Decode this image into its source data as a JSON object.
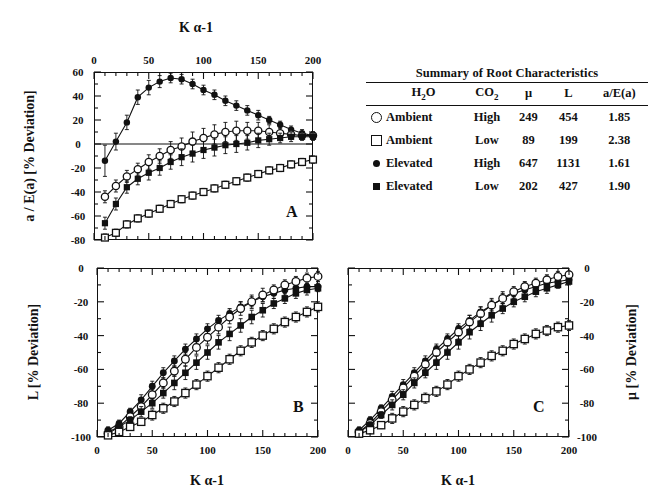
{
  "figure": {
    "top_title": "K α-1",
    "bottom_title": "K α-1"
  },
  "legend": {
    "caption": "Summary of Root Characteristics",
    "columns": [
      "H₂O",
      "CO₂",
      "μ",
      "L",
      "a/E(a)"
    ],
    "rows": [
      {
        "marker": "open-circle",
        "h2o": "Ambient",
        "co2": "High",
        "mu": "249",
        "L": "454",
        "ratio": "1.85"
      },
      {
        "marker": "open-square",
        "h2o": "Ambient",
        "co2": "Low",
        "mu": "89",
        "L": "199",
        "ratio": "2.38"
      },
      {
        "marker": "filled-circle",
        "h2o": "Elevated",
        "co2": "High",
        "mu": "647",
        "L": "1131",
        "ratio": "1.61"
      },
      {
        "marker": "filled-square",
        "h2o": "Elevated",
        "co2": "Low",
        "mu": "202",
        "L": "427",
        "ratio": "1.90"
      }
    ]
  },
  "chart_data": [
    {
      "id": "A",
      "type": "line",
      "panel_letter": "A",
      "title": "K α-1",
      "xlabel": "K α-1",
      "ylabel": "a / E(a) [% Deviation]",
      "xlim": [
        0,
        200
      ],
      "ylim": [
        -80,
        60
      ],
      "xticks": [
        0,
        50,
        100,
        150,
        200
      ],
      "yticks": [
        -80,
        -60,
        -40,
        -20,
        0,
        20,
        40,
        60
      ],
      "xtick_labels": [
        "0",
        "50",
        "100",
        "150",
        "200"
      ],
      "ytick_labels": [
        "-80",
        "-60",
        "-40",
        "-20",
        "0",
        "20",
        "40",
        "60"
      ],
      "xaxis_position": "top",
      "yaxis_position": "left",
      "grid": false,
      "zero_line": true,
      "legend_position": "external-table",
      "x": [
        10,
        20,
        30,
        40,
        50,
        60,
        70,
        80,
        90,
        100,
        110,
        120,
        130,
        140,
        150,
        160,
        170,
        180,
        190,
        200
      ],
      "series": [
        {
          "name": "Elevated / High",
          "marker": "filled-circle",
          "values": [
            -14,
            2,
            18,
            39,
            47,
            52,
            55,
            54,
            50,
            45,
            41,
            36,
            32,
            28,
            24,
            20,
            16,
            12,
            9,
            7
          ],
          "errors": [
            13,
            7,
            6,
            6,
            6,
            5,
            4,
            4,
            4,
            4,
            4,
            4,
            4,
            4,
            4,
            3,
            3,
            3,
            3,
            3
          ]
        },
        {
          "name": "Ambient / High",
          "marker": "open-circle",
          "values": [
            -44,
            -35,
            -27,
            -21,
            -15,
            -10,
            -5,
            -2,
            2,
            5,
            8,
            10,
            11,
            11,
            11,
            10,
            9,
            8,
            7,
            7
          ],
          "errors": [
            5,
            5,
            5,
            5,
            6,
            6,
            7,
            7,
            8,
            8,
            8,
            8,
            8,
            7,
            7,
            6,
            5,
            4,
            3,
            3
          ]
        },
        {
          "name": "Elevated / Low",
          "marker": "filled-square",
          "values": [
            -66,
            -50,
            -36,
            -29,
            -24,
            -20,
            -15,
            -11,
            -8,
            -5,
            -3,
            -1,
            0,
            1,
            3,
            4,
            5,
            6,
            6,
            6
          ],
          "errors": [
            5,
            5,
            5,
            5,
            6,
            6,
            6,
            7,
            7,
            7,
            7,
            7,
            7,
            6,
            6,
            5,
            4,
            4,
            3,
            3
          ]
        },
        {
          "name": "Ambient / Low",
          "marker": "open-square",
          "values": [
            -78,
            -74,
            -67,
            -62,
            -58,
            -54,
            -50,
            -46,
            -43,
            -40,
            -37,
            -34,
            -31,
            -28,
            -25,
            -22,
            -20,
            -17,
            -15,
            -13
          ],
          "errors": [
            3,
            3,
            3,
            3,
            3,
            3,
            3,
            3,
            3,
            3,
            3,
            3,
            3,
            3,
            3,
            3,
            3,
            3,
            3,
            3
          ]
        }
      ]
    },
    {
      "id": "B",
      "type": "line",
      "panel_letter": "B",
      "xlabel": "K α-1",
      "ylabel": "L [% Deviation]",
      "xlim": [
        0,
        200
      ],
      "ylim": [
        -100,
        0
      ],
      "xticks": [
        0,
        50,
        100,
        150,
        200
      ],
      "yticks": [
        -100,
        -80,
        -60,
        -40,
        -20,
        0
      ],
      "xtick_labels": [
        "0",
        "50",
        "100",
        "150",
        "200"
      ],
      "ytick_labels": [
        "-100",
        "-80",
        "-60",
        "-40",
        "-20",
        "0"
      ],
      "xaxis_position": "bottom",
      "yaxis_position": "left",
      "grid": false,
      "x": [
        10,
        20,
        30,
        40,
        50,
        60,
        70,
        80,
        90,
        100,
        110,
        120,
        130,
        140,
        150,
        160,
        170,
        180,
        190,
        200
      ],
      "series": [
        {
          "name": "Elevated / High",
          "marker": "filled-circle",
          "values": [
            -96,
            -92,
            -85,
            -78,
            -70,
            -62,
            -55,
            -48,
            -42,
            -36,
            -31,
            -27,
            -23,
            -20,
            -17,
            -15,
            -13,
            -12,
            -11,
            -11
          ],
          "errors": [
            2,
            2,
            2,
            3,
            3,
            3,
            3,
            3,
            3,
            3,
            3,
            3,
            3,
            3,
            3,
            3,
            3,
            3,
            2,
            2
          ]
        },
        {
          "name": "Ambient / High",
          "marker": "open-circle",
          "values": [
            -98,
            -94,
            -88,
            -82,
            -75,
            -68,
            -61,
            -54,
            -47,
            -41,
            -35,
            -29,
            -24,
            -20,
            -16,
            -13,
            -10,
            -8,
            -6,
            -5
          ],
          "errors": [
            2,
            2,
            2,
            3,
            3,
            3,
            3,
            4,
            4,
            4,
            4,
            4,
            4,
            4,
            4,
            3,
            3,
            3,
            3,
            3
          ]
        },
        {
          "name": "Elevated / Low",
          "marker": "filled-square",
          "values": [
            -97,
            -94,
            -90,
            -85,
            -80,
            -74,
            -68,
            -62,
            -56,
            -50,
            -44,
            -39,
            -34,
            -29,
            -25,
            -21,
            -18,
            -15,
            -13,
            -12
          ],
          "errors": [
            2,
            2,
            2,
            3,
            3,
            3,
            4,
            4,
            4,
            4,
            4,
            4,
            4,
            4,
            4,
            3,
            3,
            3,
            3,
            2
          ]
        },
        {
          "name": "Ambient / Low",
          "marker": "open-square",
          "values": [
            -99,
            -97,
            -94,
            -91,
            -87,
            -83,
            -79,
            -74,
            -69,
            -64,
            -59,
            -54,
            -49,
            -44,
            -40,
            -36,
            -32,
            -29,
            -26,
            -23
          ],
          "errors": [
            1,
            2,
            2,
            2,
            3,
            3,
            3,
            3,
            3,
            3,
            3,
            3,
            3,
            3,
            3,
            3,
            3,
            3,
            3,
            3
          ]
        }
      ]
    },
    {
      "id": "C",
      "type": "line",
      "panel_letter": "C",
      "xlabel": "K α-1",
      "ylabel": "μ [% Deviation]",
      "xlim": [
        0,
        200
      ],
      "ylim": [
        -100,
        0
      ],
      "xticks": [
        0,
        50,
        100,
        150,
        200
      ],
      "yticks": [
        -100,
        -80,
        -60,
        -40,
        -20,
        0
      ],
      "xtick_labels": [
        "0",
        "50",
        "100",
        "150",
        "200"
      ],
      "ytick_labels": [
        "-100",
        "-80",
        "-60",
        "-40",
        "-20",
        "0"
      ],
      "xaxis_position": "bottom",
      "yaxis_position": "right",
      "grid": false,
      "x": [
        10,
        20,
        30,
        40,
        50,
        60,
        70,
        80,
        90,
        100,
        110,
        120,
        130,
        140,
        150,
        160,
        170,
        180,
        190,
        200
      ],
      "series": [
        {
          "name": "Elevated / High",
          "marker": "filled-circle",
          "values": [
            -96,
            -90,
            -83,
            -76,
            -69,
            -62,
            -55,
            -48,
            -42,
            -36,
            -31,
            -26,
            -22,
            -18,
            -15,
            -13,
            -11,
            -9,
            -8,
            -7
          ],
          "errors": [
            2,
            2,
            2,
            3,
            3,
            3,
            3,
            3,
            3,
            3,
            3,
            3,
            3,
            3,
            3,
            3,
            2,
            2,
            2,
            2
          ]
        },
        {
          "name": "Ambient / High",
          "marker": "open-circle",
          "values": [
            -97,
            -92,
            -85,
            -78,
            -71,
            -64,
            -57,
            -50,
            -44,
            -38,
            -32,
            -27,
            -22,
            -18,
            -14,
            -11,
            -9,
            -7,
            -5,
            -4
          ],
          "errors": [
            2,
            2,
            2,
            3,
            3,
            3,
            3,
            4,
            4,
            4,
            4,
            4,
            4,
            4,
            3,
            3,
            3,
            3,
            3,
            2
          ]
        },
        {
          "name": "Elevated / Low",
          "marker": "filled-square",
          "values": [
            -97,
            -93,
            -87,
            -81,
            -75,
            -68,
            -62,
            -56,
            -50,
            -44,
            -38,
            -33,
            -28,
            -24,
            -20,
            -17,
            -14,
            -12,
            -10,
            -8
          ],
          "errors": [
            2,
            2,
            2,
            3,
            3,
            3,
            3,
            4,
            4,
            4,
            4,
            4,
            4,
            3,
            3,
            3,
            3,
            3,
            2,
            2
          ]
        },
        {
          "name": "Ambient / Low",
          "marker": "open-square",
          "values": [
            -98,
            -96,
            -93,
            -89,
            -85,
            -81,
            -77,
            -73,
            -69,
            -64,
            -60,
            -56,
            -52,
            -49,
            -45,
            -42,
            -39,
            -37,
            -35,
            -34
          ],
          "errors": [
            2,
            2,
            2,
            3,
            3,
            3,
            3,
            3,
            3,
            3,
            3,
            3,
            3,
            3,
            3,
            3,
            3,
            3,
            3,
            3
          ]
        }
      ]
    }
  ]
}
